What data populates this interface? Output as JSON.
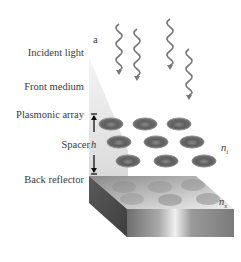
{
  "figure": {
    "panel_label": "a",
    "layers": [
      {
        "id": "incident-light",
        "label": "Incident light"
      },
      {
        "id": "front-medium",
        "label": "Front medium"
      },
      {
        "id": "plasmonic-array",
        "label": "Plasmonic array"
      },
      {
        "id": "spacer",
        "label": "Spacer"
      },
      {
        "id": "back-reflector",
        "label": "Back reflector"
      }
    ],
    "spacer_thickness_symbol": "h",
    "refractive_index_labels": {
      "incident": "n",
      "incident_sub": "i",
      "substrate": "n",
      "substrate_sub": "s"
    },
    "incident_light_waves": 4,
    "nanoparticle_rows": 3,
    "nanoparticles_per_row": 3
  }
}
